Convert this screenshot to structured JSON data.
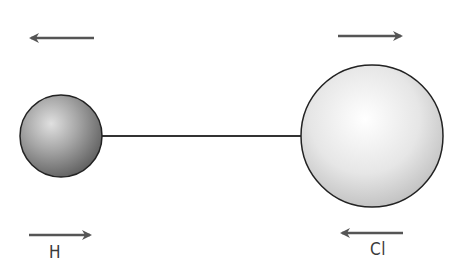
{
  "diagram": {
    "title": "",
    "colors": {
      "arrow": "#555555",
      "bond": "#333333",
      "outline": "#222222",
      "hydrogen_fill_light": "#d8d8d8",
      "hydrogen_fill_dark": "#6e6e6e",
      "chlorine_fill_light": "#fafafa",
      "chlorine_fill_dark": "#bdbdbd"
    },
    "atoms": [
      {
        "id": "H",
        "label": "H",
        "cx": 61,
        "cy": 136,
        "r": 41,
        "shade": "dark"
      },
      {
        "id": "Cl",
        "label": "Cl",
        "cx": 372,
        "cy": 136,
        "r": 71,
        "shade": "light"
      }
    ],
    "bond": {
      "x1": 101,
      "y1": 136,
      "x2": 301,
      "y2": 136
    },
    "arrows": [
      {
        "id": "top-left",
        "direction": "left",
        "x1": 94,
        "x2": 29,
        "y": 38
      },
      {
        "id": "top-right",
        "direction": "right",
        "x1": 338,
        "x2": 403,
        "y": 36
      },
      {
        "id": "bottom-left",
        "direction": "right",
        "x1": 29,
        "x2": 92,
        "y": 235
      },
      {
        "id": "bottom-right",
        "direction": "left",
        "x1": 403,
        "x2": 340,
        "y": 233
      }
    ],
    "labels": {
      "hydrogen": "H",
      "chlorine": "Cl"
    }
  }
}
